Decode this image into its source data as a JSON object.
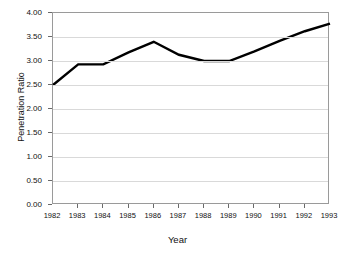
{
  "chart_data": {
    "type": "line",
    "title": "",
    "xlabel": "Year",
    "ylabel": "Penetration Ratio",
    "categories": [
      "1982",
      "1983",
      "1984",
      "1985",
      "1986",
      "1987",
      "1988",
      "1989",
      "1990",
      "1991",
      "1992",
      "1993"
    ],
    "x": [
      1982,
      1983,
      1984,
      1985,
      1986,
      1987,
      1988,
      1989,
      1990,
      1991,
      1992,
      1993
    ],
    "values": [
      2.5,
      2.93,
      2.93,
      3.18,
      3.4,
      3.13,
      3.0,
      3.0,
      3.2,
      3.42,
      3.62,
      3.78
    ],
    "series": [
      {
        "name": "Penetration Ratio",
        "values": [
          2.5,
          2.93,
          2.93,
          3.18,
          3.4,
          3.13,
          3.0,
          3.0,
          3.2,
          3.42,
          3.62,
          3.78
        ]
      }
    ],
    "ylim": [
      0.0,
      4.0
    ],
    "yticks": [
      0.0,
      0.5,
      1.0,
      1.5,
      2.0,
      2.5,
      3.0,
      3.5,
      4.0
    ],
    "ytick_labels": [
      "0.00",
      "0.50",
      "1.00",
      "1.50",
      "2.00",
      "2.50",
      "3.00",
      "3.50",
      "4.00"
    ],
    "xtick_labels": [
      "1982",
      "1983",
      "1984",
      "1985",
      "1986",
      "1987",
      "1988",
      "1989",
      "1990",
      "1991",
      "1992",
      "1993"
    ],
    "grid": true,
    "legend": null,
    "legend_position": "none",
    "line_color": "#000000",
    "grid_color": "#d9d9d9",
    "frame_color": "#9a9a9a",
    "background_color": "#ffffff"
  }
}
